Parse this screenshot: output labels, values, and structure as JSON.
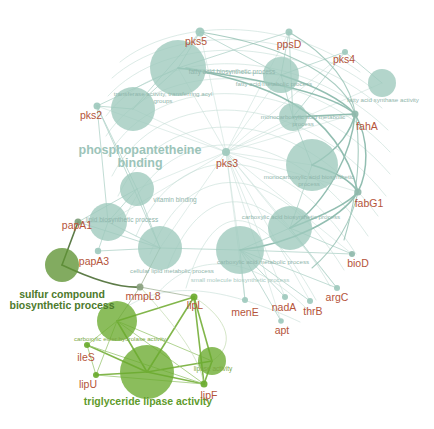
{
  "figure": {
    "type": "network-graph",
    "title": "",
    "background_color": "#ffffff",
    "palette": {
      "gene_label": "#b5543a",
      "term_teal": "#8fb5ab",
      "term_green": "#6d9e33",
      "node_teal": "#9ec9bd",
      "node_green": "#6aab2e",
      "node_dark_green": "#5f9433",
      "edge_teal": "#a9cdc3",
      "edge_green": "#7cb342",
      "edge_dark": "#4e7a4a"
    }
  },
  "nodes": {
    "genes": [
      {
        "id": "pks5",
        "label": "pks5",
        "x": 200,
        "y": 32,
        "r": 4.5,
        "color": "#9ec9bd",
        "label_x": 196,
        "label_y": 42,
        "font": 10.5
      },
      {
        "id": "ppsD",
        "label": "ppsD",
        "x": 289,
        "y": 32,
        "r": 3.5,
        "color": "#9ec9bd",
        "label_x": 289,
        "label_y": 45,
        "font": 10.5
      },
      {
        "id": "pks4",
        "label": "pks4",
        "x": 345,
        "y": 52,
        "r": 3.0,
        "color": "#9ec9bd",
        "label_x": 344,
        "label_y": 60,
        "font": 10.5
      },
      {
        "id": "pks2",
        "label": "pks2",
        "x": 97,
        "y": 106,
        "r": 3.5,
        "color": "#9ec9bd",
        "label_x": 91,
        "label_y": 116,
        "font": 10.5
      },
      {
        "id": "pks3",
        "label": "pks3",
        "x": 226,
        "y": 152,
        "r": 4.0,
        "color": "#9ec9bd",
        "label_x": 227,
        "label_y": 164,
        "font": 10.5
      },
      {
        "id": "fahA",
        "label": "fahA",
        "x": 355,
        "y": 114,
        "r": 3.5,
        "color": "#8fb8ab",
        "label_x": 367,
        "label_y": 127,
        "font": 10.5
      },
      {
        "id": "fabG1",
        "label": "fabG1",
        "x": 358,
        "y": 192,
        "r": 3.5,
        "color": "#8fb8ab",
        "label_x": 369,
        "label_y": 204,
        "font": 10.5
      },
      {
        "id": "bioD",
        "label": "bioD",
        "x": 352,
        "y": 254,
        "r": 3.0,
        "color": "#8fb8ab",
        "label_x": 358,
        "label_y": 264,
        "font": 10.5
      },
      {
        "id": "argC",
        "label": "argC",
        "x": 337,
        "y": 288,
        "r": 3.0,
        "color": "#9ec9bd",
        "label_x": 337,
        "label_y": 298,
        "font": 10.5
      },
      {
        "id": "thrB",
        "label": "thrB",
        "x": 310,
        "y": 301,
        "r": 3.0,
        "color": "#9ec9bd",
        "label_x": 313,
        "label_y": 312,
        "font": 10.5
      },
      {
        "id": "nadA",
        "label": "nadA",
        "x": 285,
        "y": 297,
        "r": 3.0,
        "color": "#9ec9bd",
        "label_x": 284,
        "label_y": 308,
        "font": 10.5
      },
      {
        "id": "menE",
        "label": "menE",
        "x": 245,
        "y": 300,
        "r": 3.0,
        "color": "#9ec9bd",
        "label_x": 245,
        "label_y": 313,
        "font": 10.5
      },
      {
        "id": "apt",
        "label": "apt",
        "x": 281,
        "y": 321,
        "r": 2.8,
        "color": "#9ec9bd",
        "label_x": 282,
        "label_y": 331,
        "font": 10.5
      },
      {
        "id": "papA1",
        "label": "papA1",
        "x": 78,
        "y": 222,
        "r": 3.5,
        "color": "#7e9e7a",
        "label_x": 77,
        "label_y": 226,
        "font": 10.5
      },
      {
        "id": "papA3",
        "label": "papA3",
        "x": 98,
        "y": 251,
        "r": 3.2,
        "color": "#9ec9bd",
        "label_x": 94,
        "label_y": 262,
        "font": 10.5
      },
      {
        "id": "mmpL8",
        "label": "mmpL8",
        "x": 140,
        "y": 287,
        "r": 3.5,
        "color": "#8aa17f",
        "label_x": 143,
        "label_y": 297,
        "font": 10.5
      },
      {
        "id": "lipL",
        "label": "lipL",
        "x": 194,
        "y": 297,
        "r": 3.5,
        "color": "#6aab2e",
        "label_x": 195,
        "label_y": 306,
        "font": 10.5
      },
      {
        "id": "ileS",
        "label": "ileS",
        "x": 87,
        "y": 345,
        "r": 3.0,
        "color": "#6aab2e",
        "label_x": 86,
        "label_y": 358,
        "font": 10.5
      },
      {
        "id": "lipU",
        "label": "lipU",
        "x": 96,
        "y": 375,
        "r": 3.0,
        "color": "#6aab2e",
        "label_x": 88,
        "label_y": 385,
        "font": 10.5
      },
      {
        "id": "lipF",
        "label": "lipF",
        "x": 204,
        "y": 384,
        "r": 3.5,
        "color": "#6aab2e",
        "label_x": 209,
        "label_y": 396,
        "font": 10.5
      }
    ],
    "terms": [
      {
        "id": "fatty-acid-biosynthetic-process",
        "label": "fatty acid biosynthetic process",
        "x": 178,
        "y": 68,
        "r": 28,
        "color": "#9ec9bd",
        "label_x": 232,
        "label_y": 72,
        "font": 6.5,
        "label_color": "#8fb5ab"
      },
      {
        "id": "fatty-acid-metabolic-process",
        "label": "fatty acid metabolic process",
        "x": 281,
        "y": 75,
        "r": 18,
        "color": "#9ec9bd",
        "label_x": 274,
        "label_y": 84,
        "font": 6.2,
        "label_color": "#8fb5ab"
      },
      {
        "id": "transferase-activity-transferring-acyl-groups",
        "label": "transferase activity, transferring acyl groups",
        "x": 133,
        "y": 109,
        "r": 22,
        "color": "#9ec9bd",
        "label_x": 163,
        "label_y": 97,
        "font": 6.2,
        "label_color": "#8fb5ab",
        "wrap": 110
      },
      {
        "id": "fatty-acid-synthase-activity",
        "label": "fatty acid synthase activity",
        "x": 382,
        "y": 83,
        "r": 14,
        "color": "#9ec9bd",
        "label_x": 383,
        "label_y": 100,
        "font": 6.2,
        "label_color": "#8fb5ab"
      },
      {
        "id": "monocarboxylic-acid-metabolic-process",
        "label": "monocarboxylic acid metabolic process",
        "x": 293,
        "y": 117,
        "r": 14,
        "color": "#9ec9bd",
        "label_x": 303,
        "label_y": 120,
        "font": 6.2,
        "label_color": "#8fb5ab",
        "wrap": 90
      },
      {
        "id": "phosphopantetheine-binding",
        "label": "phosphopantetheine binding",
        "x": 140,
        "y": 150,
        "r": 1,
        "color": "transparent",
        "label_x": 140,
        "label_y": 157,
        "font": 12.5,
        "label_color": "#9cc4b9",
        "big": true,
        "wrap": 130
      },
      {
        "id": "monocarboxylic-acid-biosynthetic-process",
        "label": "monocarboxylic acid biosynthetic process",
        "x": 312,
        "y": 165,
        "r": 26,
        "color": "#9ec9bd",
        "label_x": 309,
        "label_y": 180,
        "font": 6.2,
        "label_color": "#8fb5ab",
        "wrap": 95
      },
      {
        "id": "vitamin-binding",
        "label": "vitamin binding",
        "x": 137,
        "y": 189,
        "r": 17,
        "color": "#9ec9bd",
        "label_x": 175,
        "label_y": 200,
        "font": 6.5,
        "label_color": "#8fb5ab"
      },
      {
        "id": "carboxylic-acid-biosynthetic-process",
        "label": "carboxylic acid biosynthetic process",
        "x": 290,
        "y": 228,
        "r": 22,
        "color": "#9ec9bd",
        "label_x": 291,
        "label_y": 217,
        "font": 6.2,
        "label_color": "#8fb5ab"
      },
      {
        "id": "lipid-biosynthetic-process",
        "label": "lipid biosynthetic process",
        "x": 108,
        "y": 222,
        "r": 19,
        "color": "#9ec9bd",
        "label_x": 122,
        "label_y": 220,
        "font": 6.5,
        "label_color": "#8fb5ab"
      },
      {
        "id": "cellular-lipid-metabolic-process",
        "label": "cellular lipid metabolic process",
        "x": 160,
        "y": 248,
        "r": 22,
        "color": "#9ec9bd",
        "label_x": 172,
        "label_y": 271,
        "font": 6.2,
        "label_color": "#8fb5ab"
      },
      {
        "id": "carboxylic-acid-metabolic-process",
        "label": "carboxylic acid metabolic process",
        "x": 240,
        "y": 250,
        "r": 24,
        "color": "#9ec9bd",
        "label_x": 263,
        "label_y": 262,
        "font": 6.2,
        "label_color": "#8fb5ab"
      },
      {
        "id": "small-molecule-biosynthetic-process",
        "label": "small molecule biosynthetic process",
        "x": 240,
        "y": 250,
        "r": 0,
        "color": "transparent",
        "label_x": 240,
        "label_y": 280,
        "font": 6.2,
        "label_color": "#a8cabf"
      },
      {
        "id": "sulfur-compound-biosynthetic-process",
        "label": "sulfur compound biosynthetic process",
        "x": 62,
        "y": 265,
        "r": 17,
        "color": "#5f9433",
        "label_x": 62,
        "label_y": 300,
        "font": 10.5,
        "label_color": "#4d7a2c",
        "big": true,
        "wrap": 120
      },
      {
        "id": "carboxylic-ester-hydrolase-activity",
        "label": "carboxylic ester hydrolase activity",
        "x": 117,
        "y": 321,
        "r": 20,
        "color": "#6aab2e",
        "label_x": 120,
        "label_y": 339,
        "font": 6.2,
        "label_color": "#7aa83f"
      },
      {
        "id": "lipase-activity",
        "label": "lipase activity",
        "x": 212,
        "y": 361,
        "r": 14,
        "color": "#6aab2e",
        "label_x": 213,
        "label_y": 369,
        "font": 6.5,
        "label_color": "#7aa83f"
      },
      {
        "id": "triglyceride-lipase-activity",
        "label": "triglyceride lipase activity",
        "x": 147,
        "y": 372,
        "r": 27,
        "color": "#6aab2e",
        "label_x": 148,
        "label_y": 402,
        "font": 10.5,
        "label_color": "#5f9b2c",
        "big": true,
        "wrap": 150
      }
    ]
  },
  "edges": [
    {
      "from": "pks5",
      "to": "fatty-acid-biosynthetic-process",
      "color": "#a9cdc3",
      "width": 1.0
    },
    {
      "from": "pks5",
      "to": "transferase-activity-transferring-acyl-groups",
      "color": "#a9cdc3",
      "width": 1.0
    },
    {
      "from": "pks5",
      "to": "fatty-acid-metabolic-process",
      "color": "#a9cdc3",
      "width": 1.0
    },
    {
      "from": "ppsD",
      "to": "fatty-acid-biosynthetic-process",
      "color": "#a9cdc3",
      "width": 1.2
    },
    {
      "from": "ppsD",
      "to": "fatty-acid-metabolic-process",
      "color": "#a9cdc3",
      "width": 1.2
    },
    {
      "from": "ppsD",
      "to": "monocarboxylic-acid-metabolic-process",
      "color": "#a9cdc3",
      "width": 1.2
    },
    {
      "from": "pks4",
      "to": "fatty-acid-synthase-activity",
      "color": "#a9cdc3",
      "width": 1.0
    },
    {
      "from": "pks4",
      "to": "monocarboxylic-acid-metabolic-process",
      "color": "#a9cdc3",
      "width": 1.0
    },
    {
      "from": "pks2",
      "to": "transferase-activity-transferring-acyl-groups",
      "color": "#a9cdc3",
      "width": 1.0
    },
    {
      "from": "pks2",
      "to": "phosphopantetheine-binding",
      "color": "#a9cdc3",
      "width": 1.0
    },
    {
      "from": "pks3",
      "to": "vitamin-binding",
      "color": "#a9cdc3",
      "width": 0.8
    },
    {
      "from": "pks3",
      "to": "carboxylic-acid-biosynthetic-process",
      "color": "#a9cdc3",
      "width": 0.8
    },
    {
      "from": "fahA",
      "to": "monocarboxylic-acid-biosynthetic-process",
      "color": "#8cbcae",
      "width": 1.6
    },
    {
      "from": "fabG1",
      "to": "monocarboxylic-acid-biosynthetic-process",
      "color": "#8cbcae",
      "width": 1.6
    },
    {
      "from": "bioD",
      "to": "carboxylic-acid-biosynthetic-process",
      "color": "#a9cdc3",
      "width": 0.8
    },
    {
      "from": "argC",
      "to": "carboxylic-acid-biosynthetic-process",
      "color": "#a9cdc3",
      "width": 0.8
    },
    {
      "from": "thrB",
      "to": "carboxylic-acid-metabolic-process",
      "color": "#a9cdc3",
      "width": 0.8
    },
    {
      "from": "nadA",
      "to": "carboxylic-acid-metabolic-process",
      "color": "#a9cdc3",
      "width": 0.8
    },
    {
      "from": "menE",
      "to": "carboxylic-acid-metabolic-process",
      "color": "#a9cdc3",
      "width": 0.8
    },
    {
      "from": "papA1",
      "to": "sulfur-compound-biosynthetic-process",
      "color": "#55753f",
      "width": 1.6
    },
    {
      "from": "papA1",
      "to": "lipid-biosynthetic-process",
      "color": "#a9cdc3",
      "width": 1.0
    },
    {
      "from": "papA3",
      "to": "cellular-lipid-metabolic-process",
      "color": "#a9cdc3",
      "width": 1.0
    },
    {
      "from": "mmpL8",
      "to": "sulfur-compound-biosynthetic-process",
      "color": "#55753f",
      "width": 1.6
    },
    {
      "from": "lipL",
      "to": "triglyceride-lipase-activity",
      "color": "#7cb342",
      "width": 1.6
    },
    {
      "from": "lipL",
      "to": "carboxylic-ester-hydrolase-activity",
      "color": "#7cb342",
      "width": 1.6
    },
    {
      "from": "lipL",
      "to": "lipase-activity",
      "color": "#7cb342",
      "width": 1.6
    },
    {
      "from": "ileS",
      "to": "carboxylic-ester-hydrolase-activity",
      "color": "#9ec978",
      "width": 1.0
    },
    {
      "from": "lipU",
      "to": "triglyceride-lipase-activity",
      "color": "#7cb342",
      "width": 1.4
    },
    {
      "from": "lipF",
      "to": "triglyceride-lipase-activity",
      "color": "#7cb342",
      "width": 1.4
    },
    {
      "from": "lipF",
      "to": "lipase-activity",
      "color": "#7cb342",
      "width": 1.4
    }
  ],
  "legend": {
    "description": "Gene-term enrichment network. Teal cluster: fatty acid / polyketide metabolism. Green cluster: lipase and sulfur compound biosynthesis."
  }
}
